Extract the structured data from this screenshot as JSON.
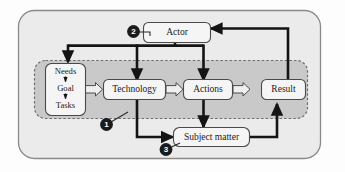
{
  "diagram": {
    "colors": {
      "outer_fill": "#ebebeb",
      "outer_stroke": "#8a8a8a",
      "inner_fill": "#c9c9c9",
      "inner_stroke": "#6e6e6e",
      "node_fill": "#f5f5f5",
      "node_stroke": "#4a4a4a",
      "arrow_solid": "#141414",
      "arrow_hollow_fill": "#efefef",
      "arrow_hollow_stroke": "#3a3a3a",
      "marker_fill": "#1b1b1b",
      "marker_text": "#ffffff",
      "page_background": "#fdfdfd"
    },
    "containers": [
      {
        "id": "outer",
        "name": "system-boundary",
        "label": ""
      },
      {
        "id": "inner",
        "name": "core-process-boundary",
        "label": ""
      }
    ],
    "nodes": [
      {
        "id": "actor",
        "label": "Actor"
      },
      {
        "id": "needs_goal_tasks",
        "label": "Needs Goal Tasks",
        "lines": [
          "Needs",
          "Goal",
          "Tasks"
        ]
      },
      {
        "id": "technology",
        "label": "Technology"
      },
      {
        "id": "actions",
        "label": "Actions"
      },
      {
        "id": "result",
        "label": "Result"
      },
      {
        "id": "subject_matter",
        "label": "Subject matter"
      }
    ],
    "markers": [
      {
        "id": "m1",
        "label": "1"
      },
      {
        "id": "m2",
        "label": "2"
      },
      {
        "id": "m3",
        "label": "3"
      }
    ],
    "edges": [
      {
        "from": "needs_goal_tasks",
        "to": "technology",
        "style": "hollow"
      },
      {
        "from": "technology",
        "to": "actions",
        "style": "hollow"
      },
      {
        "from": "actions",
        "to": "result",
        "style": "hollow"
      },
      {
        "from": "actor",
        "to": "needs_goal_tasks",
        "style": "solid"
      },
      {
        "from": "actor",
        "to": "technology",
        "style": "solid"
      },
      {
        "from": "actor",
        "to": "actions",
        "style": "solid"
      },
      {
        "from": "technology",
        "to": "subject_matter",
        "style": "solid"
      },
      {
        "from": "actions",
        "to": "subject_matter",
        "style": "solid"
      },
      {
        "from": "subject_matter",
        "to": "result",
        "style": "solid"
      },
      {
        "from": "result",
        "to": "actor",
        "style": "solid"
      }
    ]
  }
}
